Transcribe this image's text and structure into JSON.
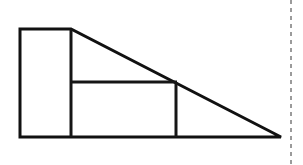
{
  "canvas": {
    "width": 303,
    "height": 165,
    "background_color": "#ffffff"
  },
  "figure": {
    "stroke_color": "#111111",
    "stroke_width": 3,
    "outline_path": "M 20 29 L 71 29 L 281 137 L 20 137 Z",
    "vertices": {
      "top_left": [
        20,
        29
      ],
      "top_notch": [
        71,
        29
      ],
      "apex_right": [
        281,
        137
      ],
      "bottom_left": [
        20,
        137
      ]
    },
    "segments": [
      {
        "name": "top-edge",
        "from": [
          20,
          29
        ],
        "to": [
          71,
          29
        ],
        "orientation": "horizontal"
      },
      {
        "name": "hypotenuse",
        "from": [
          71,
          29
        ],
        "to": [
          281,
          137
        ],
        "orientation": "diagonal"
      },
      {
        "name": "bottom-edge",
        "from": [
          20,
          137
        ],
        "to": [
          281,
          137
        ],
        "orientation": "horizontal"
      },
      {
        "name": "left-edge",
        "from": [
          20,
          29
        ],
        "to": [
          20,
          137
        ],
        "orientation": "vertical"
      },
      {
        "name": "inner-vertical-left",
        "from": [
          71,
          29
        ],
        "to": [
          71,
          137
        ],
        "orientation": "vertical"
      },
      {
        "name": "inner-horizontal",
        "from": [
          71,
          82
        ],
        "to": [
          177,
          82
        ],
        "orientation": "horizontal"
      },
      {
        "name": "inner-vertical-right",
        "from": [
          176,
          82
        ],
        "to": [
          176,
          137
        ],
        "orientation": "vertical"
      }
    ],
    "regions": [
      {
        "name": "left-rectangle",
        "corners": [
          [
            20,
            29
          ],
          [
            71,
            29
          ],
          [
            71,
            137
          ],
          [
            20,
            137
          ]
        ],
        "fill": "#ffffff"
      },
      {
        "name": "middle-rectangle",
        "corners": [
          [
            71,
            82
          ],
          [
            176,
            82
          ],
          [
            176,
            137
          ],
          [
            71,
            137
          ]
        ],
        "fill": "#ffffff"
      },
      {
        "name": "upper-triangle",
        "corners": [
          [
            71,
            29
          ],
          [
            177,
            82
          ],
          [
            71,
            82
          ]
        ],
        "fill": "#ffffff"
      },
      {
        "name": "lower-right-triangle",
        "corners": [
          [
            176,
            82
          ],
          [
            281,
            137
          ],
          [
            176,
            137
          ]
        ],
        "fill": "#ffffff"
      }
    ]
  },
  "panel_divider": {
    "name": "dashed-vertical-divider",
    "color": "#9b9b9b",
    "x": 291,
    "y_start": 0,
    "y_end": 165,
    "dash_pattern": "4 4",
    "stroke_width": 2
  }
}
